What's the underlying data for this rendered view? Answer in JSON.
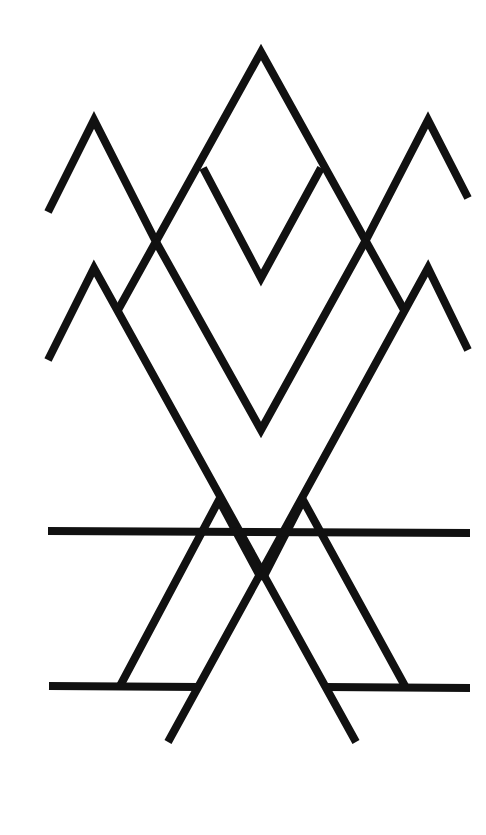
{
  "artwork": {
    "title": "Geometric mountain line art",
    "background": "#ffffff",
    "stroke_color": "#111111",
    "stroke_width": 8,
    "shapes": {
      "center_peak": "M118,310 L261,52 L404,310",
      "inner_v_upper": "M203,168 L261,278 L321,168",
      "left_peak_top": "M48,212 L94,120 L155,240",
      "right_peak_top": "M366,240 L428,120 L468,198",
      "left_peak_lower": "M48,360 L94,268 L356,742",
      "right_peak_lower": "M468,350 L428,268 L168,742",
      "lower_v": "M155,240 L261,430 L366,240",
      "left_a": "M120,686 L219,500 L262,580",
      "right_a": "M262,580 L303,500 L405,686",
      "horizontal_upper": "M48,531 L470,533",
      "horizontal_lower_left": "M49,686 L200,687",
      "horizontal_lower_right": "M326,687 L470,688"
    }
  }
}
